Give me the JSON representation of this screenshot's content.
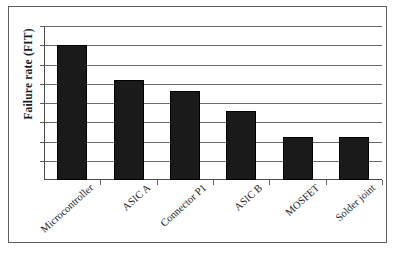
{
  "chart_data": {
    "type": "bar",
    "title": "",
    "xlabel": "",
    "ylabel": "Failure rate (FIT)",
    "categories": [
      "Microcontroller",
      "ASIC A",
      "Connector P1",
      "ASIC B",
      "MOSFET",
      "Solder joint"
    ],
    "values": [
      700,
      520,
      460,
      360,
      225,
      225
    ],
    "ylim": [
      0,
      800
    ],
    "gridlines": [
      100,
      200,
      300,
      400,
      500,
      600,
      700,
      800
    ],
    "grid": true,
    "legend": null,
    "tick_labels_y": [],
    "series": [
      {
        "name": "Failure rate (FIT)",
        "values": [
          700,
          520,
          460,
          360,
          225,
          225
        ],
        "color": "#1a1a1a"
      }
    ]
  },
  "axis": {
    "y_title": "Failure rate (FIT)"
  },
  "colors": {
    "bar": "#1a1a1a",
    "grid": "#6a6a6a",
    "axis": "#4a4a4a",
    "frame": "#5d5d5d",
    "background": "#ffffff"
  }
}
